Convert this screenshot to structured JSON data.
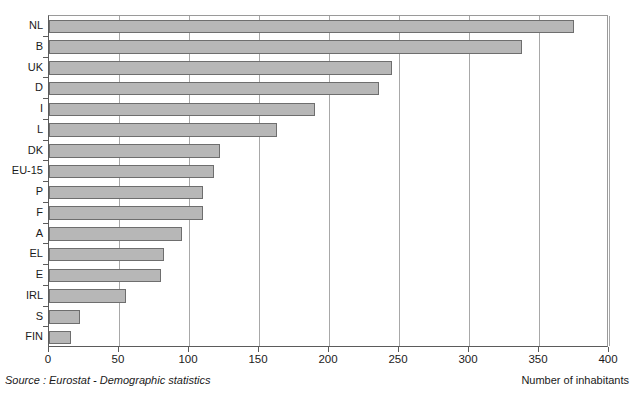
{
  "figure": {
    "cut_caption": "",
    "source_note": "Source : Eurostat - Demographic statistics",
    "axis_caption": "Number of inhabitants"
  },
  "chart_data": {
    "type": "bar",
    "orientation": "horizontal",
    "title": "",
    "subtitle": "",
    "xlabel": "Number of inhabitants",
    "ylabel": "",
    "xlim": [
      0,
      400
    ],
    "xticks": [
      0,
      50,
      100,
      150,
      200,
      250,
      300,
      350,
      400
    ],
    "xtick_labels": [
      "0",
      "50",
      "100",
      "150",
      "200",
      "250",
      "300",
      "350",
      "400"
    ],
    "grid": true,
    "grid_axis": "x",
    "legend": false,
    "legend_position": "none",
    "source": "Eurostat - Demographic statistics",
    "bar_fill_color": "#b7b7b7",
    "bar_edge_color": "#6e6e6e",
    "categories": [
      "NL",
      "B",
      "UK",
      "D",
      "I",
      "L",
      "DK",
      "EU-15",
      "P",
      "F",
      "A",
      "EL",
      "E",
      "IRL",
      "S",
      "FIN"
    ],
    "values": [
      375,
      338,
      245,
      236,
      190,
      163,
      122,
      118,
      110,
      110,
      95,
      82,
      80,
      55,
      22,
      16
    ],
    "series": [
      {
        "name": "Number of inhabitants",
        "values": [
          375,
          338,
          245,
          236,
          190,
          163,
          122,
          118,
          110,
          110,
          95,
          82,
          80,
          55,
          22,
          16
        ]
      }
    ]
  }
}
